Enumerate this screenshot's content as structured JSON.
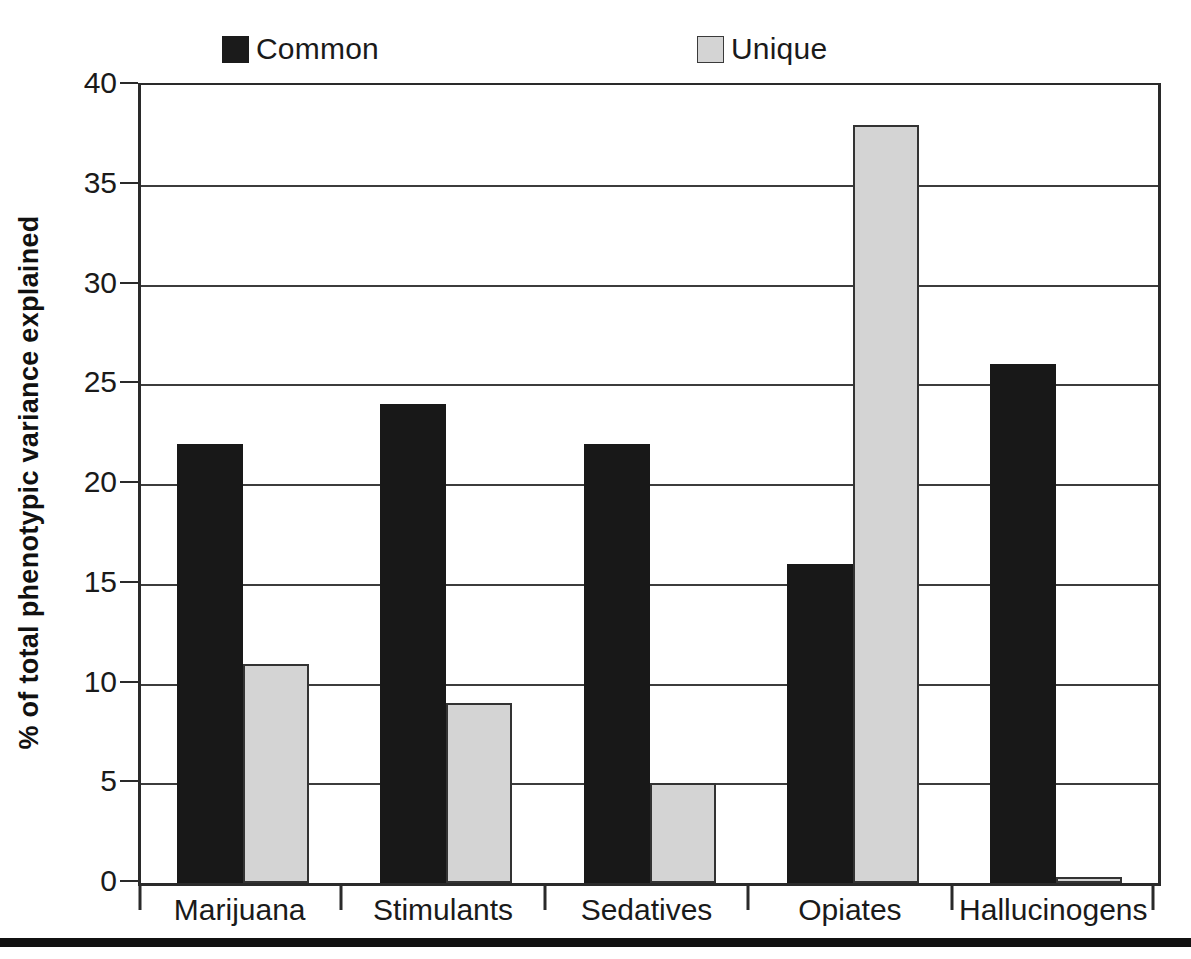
{
  "chart_data": {
    "type": "bar",
    "title": "",
    "subtitle": "",
    "xlabel": "",
    "ylabel": "% of total phenotypic variance explained",
    "categories": [
      "Marijuana",
      "Stimulants",
      "Sedatives",
      "Opiates",
      "Hallucinogens"
    ],
    "series": [
      {
        "name": "Common",
        "color": "#181818",
        "values": [
          22,
          24,
          22,
          16,
          26
        ]
      },
      {
        "name": "Unique",
        "color": "#d4d4d4",
        "values": [
          11,
          9,
          5,
          38,
          0.3
        ]
      }
    ],
    "ylim": [
      0,
      40
    ],
    "ytick_values": [
      0,
      5,
      10,
      15,
      20,
      25,
      30,
      35,
      40
    ],
    "ytick_labels": [
      "0",
      "5",
      "10",
      "15",
      "20",
      "25",
      "30",
      "35",
      "40"
    ],
    "grid": true,
    "grid_axis": "y",
    "legend_position": "top",
    "bar_group_count": 5,
    "bars_per_group": 2
  },
  "legend": {
    "entries": [
      {
        "label": "Common",
        "swatch": "dark-square-swatch"
      },
      {
        "label": "Unique",
        "swatch": "light-square-swatch"
      }
    ]
  },
  "axes": {
    "y_title": "% of total phenotypic variance explained",
    "y_ticks": [
      "40",
      "35",
      "30",
      "25",
      "20",
      "15",
      "10",
      "5",
      "0"
    ],
    "x_ticks": [
      "Marijuana",
      "Stimulants",
      "Sedatives",
      "Opiates",
      "Hallucinogens"
    ]
  },
  "colors": {
    "common": "#181818",
    "unique": "#d4d4d4",
    "axis": "#2a2a2a",
    "grid": "#3c3c3c",
    "background": "#ffffff",
    "rule": "#111111"
  }
}
